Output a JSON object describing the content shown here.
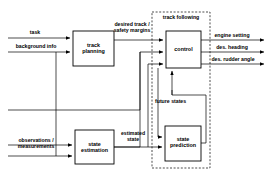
{
  "diagram": {
    "blocks": [
      {
        "id": "track-planning",
        "label": "track\nplanning",
        "x": 73,
        "y": 31,
        "w": 41,
        "h": 35
      },
      {
        "id": "state-estimation",
        "label": "state\nestimation",
        "x": 75,
        "y": 130,
        "w": 39,
        "h": 34
      },
      {
        "id": "control",
        "label": "control",
        "x": 166,
        "y": 31,
        "w": 35,
        "h": 37
      },
      {
        "id": "state-prediction",
        "label": "state\nprediction",
        "x": 165,
        "y": 126,
        "w": 36,
        "h": 35
      }
    ],
    "container": {
      "id": "track-following",
      "label": "track following",
      "x": 152,
      "y": 12,
      "w": 58,
      "h": 156,
      "style": "dashed"
    },
    "signals": [
      {
        "id": "task",
        "label": "task",
        "x": 35,
        "y": 30,
        "align": "ctr"
      },
      {
        "id": "background-info",
        "label": "background info",
        "x": 36,
        "y": 44,
        "align": "ctr"
      },
      {
        "id": "desired-track",
        "label": "desired track /\nsafety margins",
        "x": 131,
        "y": 24,
        "align": "ctr"
      },
      {
        "id": "engine-setting",
        "label": "engine setting",
        "x": 232,
        "y": 33,
        "align": "ctr"
      },
      {
        "id": "des-heading",
        "label": "des. heading",
        "x": 232,
        "y": 45,
        "align": "ctr"
      },
      {
        "id": "des-rudder-angle",
        "label": "des. rudder angle",
        "x": 233,
        "y": 57,
        "align": "ctr"
      },
      {
        "id": "future-states",
        "label": "future states",
        "x": 178,
        "y": 99,
        "align": "ctr"
      },
      {
        "id": "observations",
        "label": "observations /\nmeasurements",
        "x": 35,
        "y": 140,
        "align": "ctr"
      },
      {
        "id": "estimated-state",
        "label": "estimated\nstate",
        "x": 132,
        "y": 133,
        "align": "ctr"
      }
    ],
    "colors": {
      "line": "#000000",
      "box_fill": "#ffffff",
      "background": "#ffffff"
    }
  }
}
